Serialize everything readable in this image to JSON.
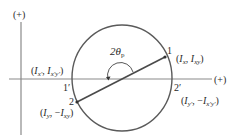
{
  "diagram": {
    "axes": {
      "vertical_label": "(+)",
      "horizontal_label": "(+)"
    },
    "points": {
      "p1": {
        "label": "1",
        "coord_main": "I",
        "coord_sub1": "x",
        "coord_sep": ", ",
        "coord_sub2": "xy"
      },
      "p2": {
        "label": "2",
        "coord_main": "I",
        "coord_sub1": "y",
        "coord_sep": ", −",
        "coord_sub2": "xy"
      },
      "p1p": {
        "label": "1′",
        "coord_sub1": "x′",
        "coord_sub2": "x′y′"
      },
      "p2p": {
        "label": "2′",
        "coord_sub1": "y′",
        "coord_sub2": "x′y′"
      }
    },
    "angle_label": "2θ",
    "angle_sub": "p",
    "colors": {
      "axis": "#7a7a7a",
      "circle": "#5a5a5a",
      "line": "#4a4a4a",
      "text": "#2a2a2a"
    }
  }
}
